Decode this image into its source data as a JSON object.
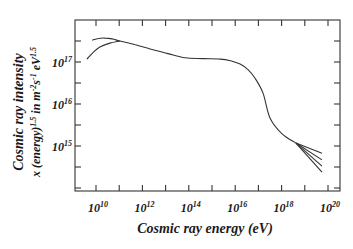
{
  "chart_data": {
    "type": "line",
    "title": "",
    "xlabel": "Cosmic ray energy (eV)",
    "ylabel": [
      "Cosmic ray intensity",
      "x (energy)^1.5 in m^-2 s^-1 eV^1.5"
    ],
    "ylabel_parts": {
      "line1": "Cosmic ray intensity",
      "line2_prefix": "x (energy)",
      "line2_exp1": "1.5",
      "line2_mid": " in m",
      "line2_exp2": "-2",
      "line2_s": "s",
      "line2_exp3": "-1",
      "line2_ev": " eV",
      "line2_exp4": "1.5"
    },
    "x_scale": "log",
    "y_scale": "log",
    "xlim_log10": [
      8.8,
      20.6
    ],
    "ylim_log10": [
      14.0,
      18.0
    ],
    "grid": false,
    "legend": "none",
    "x_ticks": [
      {
        "base": "10",
        "exp": "10",
        "log10": 10
      },
      {
        "base": "10",
        "exp": "12",
        "log10": 12
      },
      {
        "base": "10",
        "exp": "14",
        "log10": 14
      },
      {
        "base": "10",
        "exp": "16",
        "log10": 16
      },
      {
        "base": "10",
        "exp": "18",
        "log10": 18
      },
      {
        "base": "10",
        "exp": "20",
        "log10": 20
      }
    ],
    "y_ticks": [
      {
        "base": "10",
        "exp": "17",
        "log10": 17
      },
      {
        "base": "10",
        "exp": "16",
        "log10": 16
      },
      {
        "base": "10",
        "exp": "15",
        "log10": 15
      }
    ],
    "series": [
      {
        "name": "main spectrum (solar minimum branch)",
        "log10_energy": [
          9.83,
          10.1,
          10.39,
          10.7,
          11.03,
          11.7,
          12.33,
          13.1,
          13.84,
          14.6,
          15.34,
          15.8,
          16.21,
          16.55,
          16.85,
          17.2,
          17.5,
          18.02,
          18.62
        ],
        "log10_intensity": [
          17.52,
          17.56,
          17.57,
          17.55,
          17.5,
          17.41,
          17.31,
          17.2,
          17.1,
          17.08,
          17.07,
          17.03,
          16.95,
          16.82,
          16.62,
          16.26,
          15.67,
          15.29,
          15.07
        ]
      },
      {
        "name": "solar maximum branch",
        "log10_energy": [
          9.61,
          9.9,
          10.17,
          10.6,
          11.03
        ],
        "log10_intensity": [
          17.07,
          17.24,
          17.36,
          17.45,
          17.5
        ]
      },
      {
        "name": "high-energy uncertainty fan",
        "log10_energy_start": 18.62,
        "log10_intensity_start": 15.07,
        "log10_energy_end": 19.74,
        "log10_intensity_ends": [
          14.83,
          14.67,
          14.52,
          14.38
        ]
      }
    ]
  }
}
